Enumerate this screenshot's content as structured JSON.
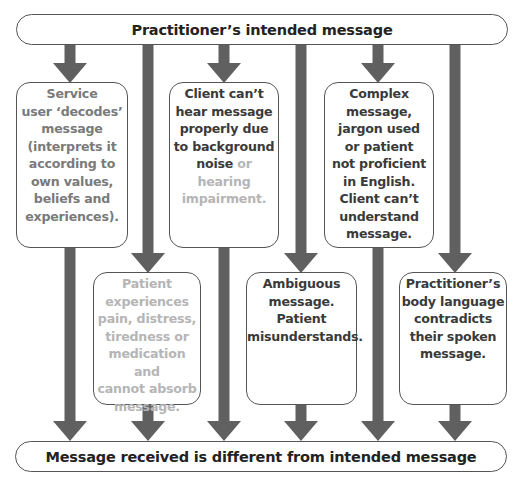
{
  "top_box": {
    "label": "Practitioner’s intended message"
  },
  "bottom_box": {
    "label": "Message received is different from intended message"
  },
  "colors": {
    "arrow": "#606060",
    "border": "#555555",
    "text_dark": "#3a3a3a",
    "text_faded": "#b5b5b5",
    "text_mid": "#7a7a7a"
  },
  "barriers": [
    {
      "id": "decodes",
      "row": 1,
      "style": "mid",
      "parts": [
        {
          "text": "Service user ‘decodes’ message (interprets it according to own values, beliefs and experiences).",
          "tone": "mid"
        }
      ]
    },
    {
      "id": "hearing",
      "row": 1,
      "style": "dark",
      "parts": [
        {
          "text": "Client can’t hear message properly due to background noise",
          "tone": "dark"
        },
        {
          "text": " or hearing impairment.",
          "tone": "faded"
        }
      ]
    },
    {
      "id": "complex",
      "row": 1,
      "style": "dark",
      "parts": [
        {
          "text": "Complex message, jargon used or patient not proficient in English. Client can’t understand message.",
          "tone": "dark"
        }
      ]
    },
    {
      "id": "patient-state",
      "row": 2,
      "style": "faded",
      "parts": [
        {
          "text": "Patient experiences pain, distress, tiredness or medication and cannot absorb message.",
          "tone": "faded"
        }
      ]
    },
    {
      "id": "ambiguous",
      "row": 2,
      "style": "dark",
      "parts": [
        {
          "text": "Ambiguous message. Patient misunderstands.",
          "tone": "dark"
        }
      ]
    },
    {
      "id": "body-language",
      "row": 2,
      "style": "dark",
      "parts": [
        {
          "text": "Practitioner’s body language contradicts their spoken message.",
          "tone": "dark"
        }
      ]
    }
  ],
  "lines": {
    "decodes": [
      "Service",
      "user ‘decodes’",
      "message",
      "(interprets it",
      "according to",
      "own values,",
      "beliefs and",
      "experiences)."
    ],
    "hearing": [
      "Client can’t",
      "hear message",
      "properly due",
      "to background",
      "noise|or",
      "hearing",
      "impairment."
    ],
    "complex": [
      "Complex",
      "message,",
      "jargon used",
      "or patient",
      "not proficient",
      "in English.",
      "Client can’t",
      "understand",
      "message."
    ],
    "patient-state": [
      "Patient",
      "experiences",
      "pain, distress,",
      "tiredness or",
      "medication and",
      "cannot absorb",
      "message."
    ],
    "ambiguous": [
      "Ambiguous",
      "message.",
      "Patient",
      "misunderstands."
    ],
    "body-language": [
      "Practitioner’s",
      "body language",
      "contradicts",
      "their spoken",
      "message."
    ]
  }
}
